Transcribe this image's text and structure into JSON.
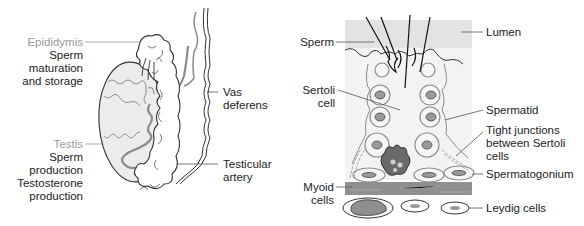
{
  "left_figure": {
    "labels": {
      "epididymis": {
        "title": "Epididymis",
        "lines": [
          "Sperm",
          "maturation",
          "and storage"
        ]
      },
      "testis": {
        "title": "Testis",
        "lines": [
          "Sperm",
          "production",
          "Testosterone",
          "production"
        ]
      },
      "vas_deferens": {
        "lines": [
          "Vas",
          "deferens"
        ]
      },
      "testicular_artery": {
        "lines": [
          "Testicular",
          "artery"
        ]
      }
    }
  },
  "right_figure": {
    "labels": {
      "sperm": "Sperm",
      "lumen": "Lumen",
      "sertoli_cell": [
        "Sertoli",
        "cell"
      ],
      "spermatid": "Spermatid",
      "tight_junctions": [
        "Tight junctions",
        "between Sertoli",
        "cells"
      ],
      "spermatogonium": "Spermatogonium",
      "myoid_cells": [
        "Myoid",
        "cells"
      ],
      "leydig_cells": "Leydig cells"
    }
  },
  "colors": {
    "title_grey": "#9a9a9a",
    "text": "#222222",
    "testis_fill": "#ececec",
    "artery": "#8c8c8c",
    "lumen_bg": "#e6e6e6",
    "tubule_bg": "#f3f3f3",
    "nucleus": "#9a9a9a",
    "myoid_band": "#8f8f8f"
  }
}
